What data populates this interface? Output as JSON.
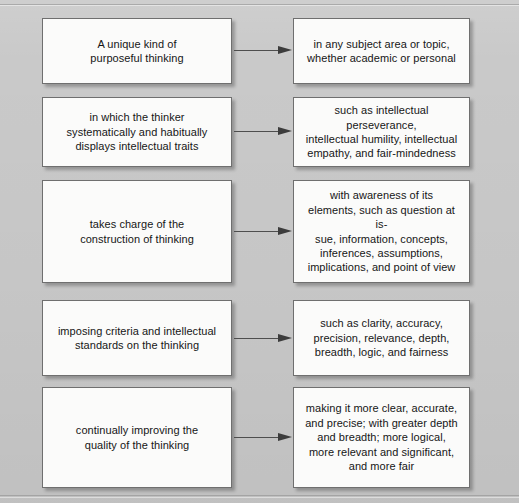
{
  "diagram": {
    "type": "flow",
    "background_color": "#c9c9c9",
    "node_fill_color": "#fbfbfa",
    "node_border_color": "#6f6f6f",
    "text_color": "#161616",
    "arrow_color": "#3c3c3c",
    "arrow_label": "leads-to-arrow",
    "rows": [
      {
        "id": "row-1",
        "left": {
          "name": "node-unique-kind",
          "text": "A unique kind of\npurposeful thinking"
        },
        "right": {
          "name": "node-subject-area",
          "text": "in any subject area or topic,\nwhether academic or personal"
        }
      },
      {
        "id": "row-2",
        "left": {
          "name": "node-intellectual-traits",
          "text": "in which the thinker\nsystematically and habitually\ndisplays intellectual traits"
        },
        "right": {
          "name": "node-traits-examples",
          "text": "such as intellectual perseverance,\nintellectual humility, intellectual\nempathy, and fair-mindedness"
        }
      },
      {
        "id": "row-3",
        "left": {
          "name": "node-construction-of-thinking",
          "text": "takes charge of the\nconstruction of thinking"
        },
        "right": {
          "name": "node-elements-of-thought",
          "text": "with awareness of its\nelements, such as question at is-\nsue, information, concepts,\ninferences, assumptions,\nimplications, and point of view"
        }
      },
      {
        "id": "row-4",
        "left": {
          "name": "node-imposing-criteria",
          "text": "imposing criteria and intellectual\nstandards on the thinking"
        },
        "right": {
          "name": "node-intellectual-standards",
          "text": "such as clarity, accuracy,\nprecision, relevance, depth,\nbreadth, logic, and fairness"
        }
      },
      {
        "id": "row-5",
        "left": {
          "name": "node-continually-improving",
          "text": "continually improving the\nquality of the thinking"
        },
        "right": {
          "name": "node-improvement-outcomes",
          "text": "making it more clear, accurate,\nand precise; with greater depth\nand breadth; more logical,\nmore relevant and significant,\nand more fair"
        }
      }
    ]
  }
}
